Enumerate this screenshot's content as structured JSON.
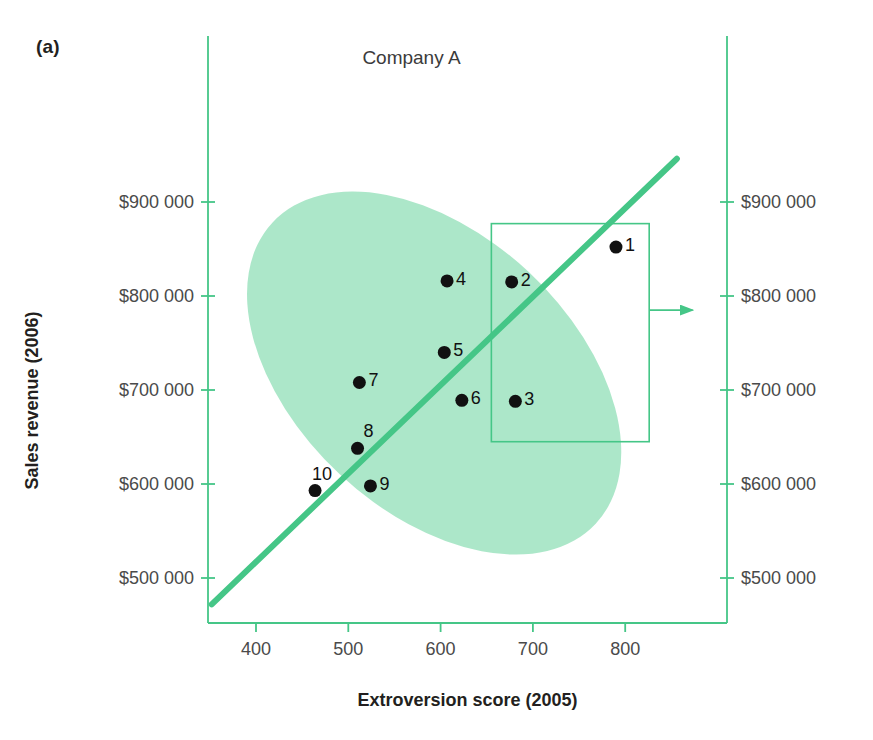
{
  "figure": {
    "panel_label": "(a)",
    "title": "Company A",
    "accent_color": "#45c687",
    "ellipse_fill": "#a8e6c6",
    "point_color": "#111111"
  },
  "chart_data": {
    "type": "scatter",
    "title": "Company A",
    "xlabel": "Extroversion score (2005)",
    "ylabel": "Sales revenue (2006)",
    "xlim": [
      350,
      860
    ],
    "ylim": [
      455,
      950000
    ],
    "grid": false,
    "legend": "none",
    "x_ticks": [
      400,
      500,
      600,
      700,
      800
    ],
    "x_tick_labels": [
      "400",
      "500",
      "600",
      "700",
      "800"
    ],
    "y_ticks": [
      900000,
      800000,
      700000,
      600000,
      500000
    ],
    "y_tick_labels": [
      "$900 000",
      "$800 000",
      "$700 000",
      "$600 000",
      "$500 000"
    ],
    "y_tick_labels_right": [
      "$900 000",
      "$800 000",
      "$700 000",
      "$600 000",
      "$500 000"
    ],
    "points": [
      {
        "label": "1",
        "x": 790,
        "y": 852000
      },
      {
        "label": "2",
        "x": 677,
        "y": 815000
      },
      {
        "label": "3",
        "x": 681,
        "y": 688000
      },
      {
        "label": "4",
        "x": 607,
        "y": 816000
      },
      {
        "label": "5",
        "x": 604,
        "y": 740000
      },
      {
        "label": "6",
        "x": 623,
        "y": 689000
      },
      {
        "label": "7",
        "x": 512,
        "y": 708000
      },
      {
        "label": "8",
        "x": 510,
        "y": 638000
      },
      {
        "label": "9",
        "x": 524,
        "y": 598000
      },
      {
        "label": "10",
        "x": 464,
        "y": 593000
      }
    ],
    "trend_line": {
      "x0": 352,
      "y0": 472000,
      "x1": 856,
      "y1": 946000
    },
    "confidence_ellipse": {
      "center_x": 593,
      "center_y": 718000,
      "width": 300,
      "height": 470000,
      "angle_deg": -47
    },
    "callout_rect": {
      "x0": 655,
      "y0": 645000,
      "x1": 826,
      "y1": 877000
    },
    "callout_arrow": {
      "from_x": 826,
      "from_y": 785000,
      "to_x": 860,
      "to_y": 785000
    }
  }
}
